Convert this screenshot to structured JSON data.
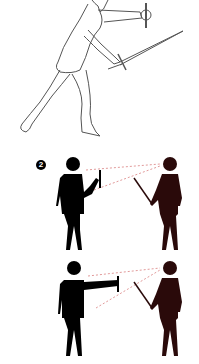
{
  "figure": {
    "panel_1": {
      "description": "sketched fencer lunging with sword, off-hand extended holding guard",
      "line_color": "#555555"
    },
    "panel_2": {
      "marker": "2",
      "left_figure_color": "#000000",
      "right_figure_color": "#2a0a0a",
      "sight_line_color": "#d98080",
      "description": "left figure holds weapon near chest; dotted sight lines to opponent"
    },
    "panel_3": {
      "left_figure_color": "#000000",
      "right_figure_color": "#2a0a0a",
      "sight_line_color": "#d98080",
      "description": "left figure extends arm with weapon; dotted sight lines to opponent"
    }
  }
}
